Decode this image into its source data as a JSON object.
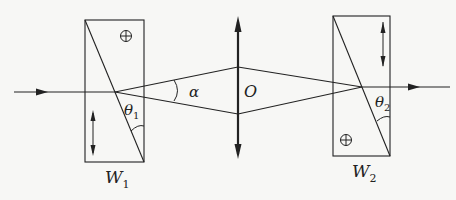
{
  "diagram": {
    "type": "optics-schematic",
    "colors": {
      "line": "#222222",
      "background": "#f7f7f5"
    },
    "labels": {
      "alpha": "α",
      "lens": "O",
      "theta1": "θ",
      "theta1_sub": "1",
      "theta2": "θ",
      "theta2_sub": "2",
      "w1": "W",
      "w1_sub": "1",
      "w2": "W",
      "w2_sub": "2"
    },
    "components": [
      {
        "id": "W1",
        "kind": "wollaston-prism",
        "upper_axis": "into-page (⊕)",
        "lower_axis": "vertical (↕)"
      },
      {
        "id": "O",
        "kind": "converging-lens"
      },
      {
        "id": "W2",
        "kind": "wollaston-prism",
        "upper_axis": "vertical (↕)",
        "lower_axis": "into-page (⊕)"
      }
    ],
    "symbols": {
      "into_page": "⊕",
      "vertical": "↕"
    }
  }
}
